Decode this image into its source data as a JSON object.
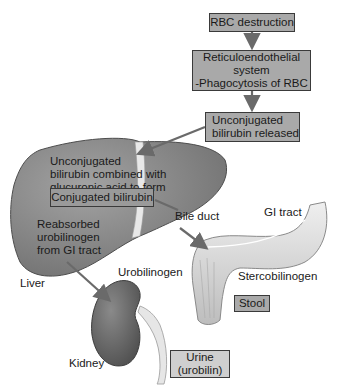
{
  "diagram": {
    "colors": {
      "box_fill": "#a9a9a9",
      "box_border": "#3a3a3a",
      "organ_fill": "#7d7d7d",
      "arrow": "#6a6a6a"
    },
    "flow_boxes": {
      "rbc_destruction": "RBC destruction",
      "reticuloendothelial": {
        "line1": "Reticuloendothelial",
        "line2": "system",
        "line3": "-Phagocytosis of RBC"
      },
      "unconjugated_released": {
        "line1": "Unconjugated",
        "line2": "bilirubin released"
      }
    },
    "liver_text": {
      "line1": "Unconjugated",
      "line2": "bilirubin combined with",
      "line3": "glucuronic acid to form"
    },
    "conjugated_box": "Conjugated bilirubin",
    "reabsorbed": {
      "line1": "Reabsorbed",
      "line2": "urobilinogen",
      "line3": "from GI tract"
    },
    "labels": {
      "liver": "Liver",
      "bile_duct": "Bile duct",
      "gi_tract": "GI tract",
      "stercobilinogen": "Stercobilinogen",
      "urobilinogen": "Urobilinogen",
      "kidney": "Kidney"
    },
    "stool_box": "Stool",
    "urine_box": {
      "line1": "Urine",
      "line2": "(urobilin)"
    }
  }
}
